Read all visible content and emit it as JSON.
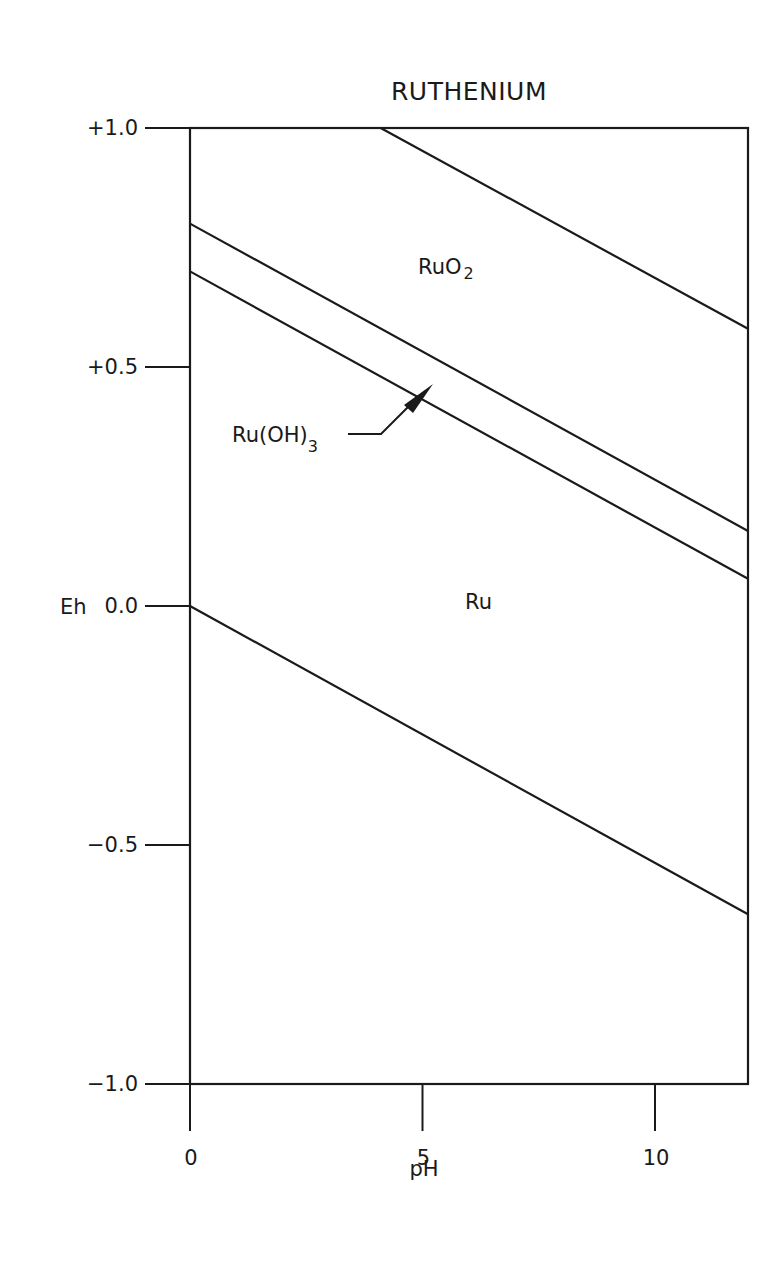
{
  "chart_data": {
    "type": "line",
    "title": "RUTHENIUM",
    "xlabel": "pH",
    "ylabel": "Eh",
    "xlim": [
      0,
      12
    ],
    "ylim": [
      -1.0,
      1.0
    ],
    "x_ticks": [
      {
        "value": 0,
        "label": "0"
      },
      {
        "value": 5,
        "label": "5"
      },
      {
        "value": 10,
        "label": "10"
      }
    ],
    "y_ticks": [
      {
        "value": 1.0,
        "label": "+1.0"
      },
      {
        "value": 0.5,
        "label": "+0.5"
      },
      {
        "value": 0.0,
        "label": "0.0"
      },
      {
        "value": -0.5,
        "label": "-0.5"
      },
      {
        "value": -1.0,
        "label": "-1.0"
      }
    ],
    "grid": false,
    "series": [
      {
        "name": "RuO2 upper boundary",
        "x": [
          4.1,
          12
        ],
        "y": [
          1.0,
          0.58
        ]
      },
      {
        "name": "RuO2 / Ru(OH)3 boundary",
        "x": [
          0,
          12
        ],
        "y": [
          0.8,
          0.157
        ]
      },
      {
        "name": "Ru(OH)3 / Ru boundary",
        "x": [
          0,
          12
        ],
        "y": [
          0.7,
          0.057
        ]
      },
      {
        "name": "Ru lower boundary",
        "x": [
          0,
          12
        ],
        "y": [
          0.0,
          -0.645
        ]
      }
    ],
    "annotations": [
      {
        "text": "RuO",
        "subscript": "2",
        "x": 5.3,
        "y": 0.69
      },
      {
        "text": "Ru(OH)",
        "subscript": "3",
        "x": 0.8,
        "y": 0.35,
        "arrow_to": {
          "x": 5.2,
          "y": 0.47
        }
      },
      {
        "text": "Ru",
        "x": 6.0,
        "y": 0.0
      }
    ]
  }
}
